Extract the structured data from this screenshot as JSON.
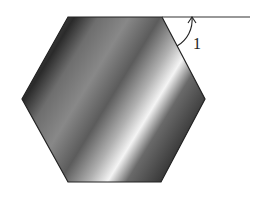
{
  "figure": {
    "shape": "regular hexagon",
    "angle_label": "1",
    "colors": {
      "stroke": "#222222",
      "fill_dark": "#2a2a2a",
      "fill_mid": "#8a8a8a",
      "fill_light": "#f4f4f4"
    }
  }
}
